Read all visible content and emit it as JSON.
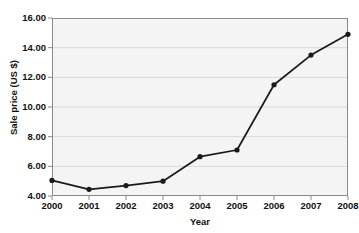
{
  "chart_data": {
    "type": "line",
    "title": "",
    "xlabel": "Year",
    "ylabel": "Sale price (US $)",
    "categories": [
      "2000",
      "2001",
      "2002",
      "2003",
      "2004",
      "2005",
      "2006",
      "2007",
      "2008"
    ],
    "x": [
      2000,
      2001,
      2002,
      2003,
      2004,
      2005,
      2006,
      2007,
      2008
    ],
    "values": [
      5.05,
      4.45,
      4.7,
      5.0,
      6.65,
      7.1,
      11.5,
      13.5,
      14.9
    ],
    "series": [
      {
        "name": "Sale price",
        "values": [
          5.05,
          4.45,
          4.7,
          5.0,
          6.65,
          7.1,
          11.5,
          13.5,
          14.9
        ]
      }
    ],
    "xlim": [
      2000,
      2008
    ],
    "ylim": [
      4.0,
      16.0
    ],
    "ytick_labels": [
      "16.00",
      "14.00",
      "12.00",
      "10.00",
      "8.00",
      "6.00",
      "4.00"
    ],
    "ytick_values": [
      16.0,
      14.0,
      12.0,
      10.0,
      8.0,
      6.0,
      4.0
    ],
    "xtick_labels": [
      "2000",
      "2001",
      "2002",
      "2003",
      "2004",
      "2005",
      "2006",
      "2007",
      "2008"
    ],
    "grid": true,
    "grid_axis": "y",
    "legend": null,
    "legend_position": "none",
    "marker": "circle",
    "line_color": "#1a1a1a",
    "marker_color": "#1a1a1a",
    "plot_background": "#f4f4f4",
    "grid_color": "#d8d8d8",
    "axis_color": "#8a8a8a"
  }
}
